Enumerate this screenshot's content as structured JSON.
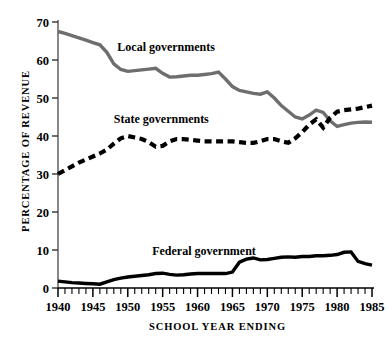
{
  "chart_data": {
    "type": "line",
    "title": "",
    "xlabel": "SCHOOL YEAR ENDING",
    "ylabel": "PERCENTAGE OF REVENUE",
    "xlim": [
      1940,
      1985
    ],
    "ylim": [
      0,
      70
    ],
    "grid": false,
    "legend_position": "inline-annotations",
    "x_tick_labels": [
      "1940",
      "1945",
      "1950",
      "1955",
      "1960",
      "1965",
      "1970",
      "1975",
      "1980",
      "1985"
    ],
    "x_tick_values": [
      1940,
      1945,
      1950,
      1955,
      1960,
      1965,
      1970,
      1975,
      1980,
      1985
    ],
    "x_minor_tick_interval": 1,
    "y_tick_labels": [
      "0",
      "10",
      "20",
      "30",
      "40",
      "50",
      "60",
      "70"
    ],
    "y_tick_values": [
      0,
      10,
      20,
      30,
      40,
      50,
      60,
      70
    ],
    "x": [
      1940,
      1941,
      1942,
      1943,
      1944,
      1945,
      1946,
      1947,
      1948,
      1949,
      1950,
      1951,
      1952,
      1953,
      1954,
      1955,
      1956,
      1957,
      1958,
      1959,
      1960,
      1961,
      1962,
      1963,
      1964,
      1965,
      1966,
      1967,
      1968,
      1969,
      1970,
      1971,
      1972,
      1973,
      1974,
      1975,
      1976,
      1977,
      1978,
      1979,
      1980,
      1981,
      1982,
      1983,
      1984,
      1985
    ],
    "series": [
      {
        "name": "Local governments",
        "color": "#6e6e6e",
        "style": "solid",
        "label_position": {
          "x": 1948.5,
          "y": 62.5
        },
        "values": [
          67.5,
          67.0,
          66.4,
          65.8,
          65.2,
          64.6,
          64.0,
          62.0,
          59.0,
          57.5,
          57.0,
          57.2,
          57.4,
          57.6,
          57.8,
          56.5,
          55.5,
          55.6,
          55.8,
          56.0,
          56.0,
          56.2,
          56.4,
          56.8,
          55.0,
          53.0,
          52.0,
          51.6,
          51.2,
          51.0,
          51.6,
          50.0,
          48.0,
          46.5,
          45.0,
          44.5,
          45.5,
          46.8,
          46.2,
          44.0,
          42.5,
          43.0,
          43.4,
          43.6,
          43.7,
          43.6
        ]
      },
      {
        "name": "State governments",
        "color": "#000000",
        "style": "dashed",
        "label_position": {
          "x": 1948.0,
          "y": 43.5
        },
        "values": [
          30.0,
          31.0,
          32.0,
          33.0,
          33.8,
          34.6,
          35.4,
          36.4,
          38.0,
          39.4,
          40.0,
          39.6,
          39.2,
          38.4,
          37.2,
          37.4,
          38.6,
          39.2,
          39.2,
          39.0,
          38.8,
          38.6,
          38.6,
          38.6,
          38.6,
          38.6,
          38.4,
          38.2,
          38.2,
          38.6,
          39.2,
          39.2,
          38.6,
          38.2,
          39.4,
          41.0,
          43.0,
          44.4,
          42.2,
          44.8,
          46.4,
          46.8,
          47.0,
          47.2,
          47.6,
          48.0
        ]
      },
      {
        "name": "Federal government",
        "color": "#000000",
        "style": "solid",
        "label_position": {
          "x": 1953.5,
          "y": 8.6
        },
        "values": [
          1.8,
          1.6,
          1.4,
          1.3,
          1.2,
          1.1,
          1.0,
          1.6,
          2.2,
          2.6,
          2.9,
          3.1,
          3.3,
          3.5,
          3.8,
          3.9,
          3.6,
          3.4,
          3.5,
          3.7,
          3.8,
          3.8,
          3.8,
          3.8,
          3.8,
          4.2,
          6.8,
          7.6,
          7.9,
          7.4,
          7.5,
          7.8,
          8.1,
          8.2,
          8.1,
          8.3,
          8.3,
          8.5,
          8.5,
          8.6,
          8.8,
          9.4,
          9.5,
          7.0,
          6.4,
          6.0
        ]
      }
    ]
  }
}
